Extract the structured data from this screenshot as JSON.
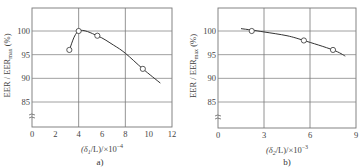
{
  "chart_data": [
    {
      "type": "line",
      "caption": "a)",
      "xlabel": "(δ1/L)/×10^-4",
      "ylabel": "EER / EER_max (%)",
      "xlim": [
        0,
        12
      ],
      "ylim": [
        80,
        104
      ],
      "x_ticks": [
        "0",
        "2",
        "4",
        "6",
        "8",
        "10",
        "12"
      ],
      "y_ticks": [
        "85",
        "90",
        "95",
        "100"
      ],
      "grid": true,
      "axis_break": true,
      "markers": {
        "x": [
          3.2,
          4.0,
          5.6,
          9.5
        ],
        "y": [
          96,
          100,
          99,
          92
        ]
      },
      "curve": {
        "x": [
          3.2,
          4.0,
          5.6,
          7.0,
          8.0,
          9.5,
          11.0
        ],
        "y": [
          96,
          100,
          99,
          97,
          95.3,
          92,
          89
        ]
      }
    },
    {
      "type": "line",
      "caption": "b)",
      "xlabel": "(δ2/L)/×10^-3",
      "ylabel": "EER / EER_max (%)",
      "xlim": [
        0,
        9
      ],
      "ylim": [
        80,
        104
      ],
      "x_ticks": [
        "0",
        "3",
        "6",
        "9"
      ],
      "y_ticks": [
        "85",
        "90",
        "95",
        "100"
      ],
      "grid": true,
      "axis_break": true,
      "markers": {
        "x": [
          2.2,
          5.6,
          7.5
        ],
        "y": [
          100,
          98,
          96
        ]
      },
      "curve": {
        "x": [
          1.5,
          2.2,
          3.0,
          4.5,
          5.6,
          7.5,
          8.3
        ],
        "y": [
          100.5,
          100.2,
          99.8,
          99,
          98,
          96,
          94.7
        ]
      }
    }
  ],
  "labels": {
    "a": {
      "caption": "a)",
      "xlabel_main": "(δ",
      "xlabel_sub": "1",
      "xlabel_rest": "/L)/×10",
      "xlabel_exp": "−4",
      "ylabel_main": "EER / EER",
      "ylabel_sub": "max",
      "ylabel_rest": " (%)"
    },
    "b": {
      "caption": "b)",
      "xlabel_main": "(δ",
      "xlabel_sub": "2",
      "xlabel_rest": "/L)/×10",
      "xlabel_exp": "−3",
      "ylabel_main": "EER / EER",
      "ylabel_sub": "max",
      "ylabel_rest": " (%)"
    }
  }
}
